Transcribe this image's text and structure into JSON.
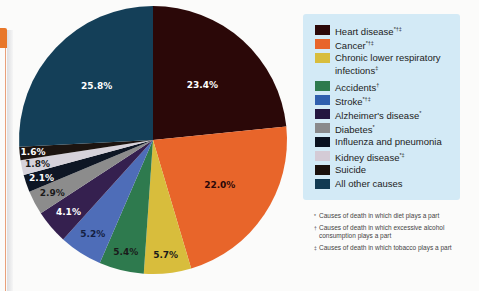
{
  "chart_data": {
    "type": "pie",
    "title": "",
    "start_angle": "12 o'clock",
    "direction": "clockwise",
    "slices": [
      {
        "name": "Heart disease",
        "marks": "*†‡",
        "value": 23.4,
        "label": "23.4%",
        "color": "#2b0808",
        "label_color": "#ffffff"
      },
      {
        "name": "Cancer",
        "marks": "*†‡",
        "value": 22.0,
        "label": "22.0%",
        "color": "#e8652a",
        "label_color": "#2b0808"
      },
      {
        "name": "Chronic lower respiratory infections",
        "marks": "‡",
        "value": 5.7,
        "label": "5.7%",
        "color": "#d8bd3c",
        "label_color": "#1a1a1a"
      },
      {
        "name": "Accidents",
        "marks": "†",
        "value": 5.4,
        "label": "5.4%",
        "color": "#2e7a4e",
        "label_color": "#1a1a1a"
      },
      {
        "name": "Stroke",
        "marks": "*†‡",
        "value": 5.2,
        "label": "5.2%",
        "color": "#4e6db8",
        "label_color": "#142041"
      },
      {
        "name": "Alzheimer's disease",
        "marks": "*",
        "value": 4.1,
        "label": "4.1%",
        "color": "#35204f",
        "label_color": "#ffffff"
      },
      {
        "name": "Diabetes",
        "marks": "*",
        "value": 2.9,
        "label": "2.9%",
        "color": "#8c8c8c",
        "label_color": "#1a1a1a"
      },
      {
        "name": "Influenza and pneumonia",
        "marks": "",
        "value": 2.1,
        "label": "2.1%",
        "color": "#0e1624",
        "label_color": "#ffffff"
      },
      {
        "name": "Kidney disease",
        "marks": "*‡",
        "value": 1.8,
        "label": "1.8%",
        "color": "#d6d2da",
        "label_color": "#1a1a1a"
      },
      {
        "name": "Suicide",
        "marks": "",
        "value": 1.6,
        "label": "1.6%",
        "color": "#1c1410",
        "label_color": "#ffffff"
      },
      {
        "name": "All other causes",
        "marks": "",
        "value": 25.8,
        "label": "25.8%",
        "color": "#143f58",
        "label_color": "#ffffff"
      }
    ],
    "legend_position": "right"
  },
  "legend": {
    "items": [
      {
        "label": "Heart disease",
        "marks": "*†‡",
        "color": "#2b0808"
      },
      {
        "label": "Cancer",
        "marks": "*†‡",
        "color": "#e8652a"
      },
      {
        "label": "Chronic lower respiratory infections",
        "marks": "‡",
        "color": "#d8bd3c"
      },
      {
        "label": "Accidents",
        "marks": "†",
        "color": "#2e7a4e"
      },
      {
        "label": "Stroke",
        "marks": "*†‡",
        "color": "#2f5fae"
      },
      {
        "label": "Alzheimer's disease",
        "marks": "*",
        "color": "#231640"
      },
      {
        "label": "Diabetes",
        "marks": "*",
        "color": "#8a8a8c"
      },
      {
        "label": "Influenza and pneumonia",
        "marks": "",
        "color": "#0b1220"
      },
      {
        "label": "Kidney disease",
        "marks": "*‡",
        "color": "#d4cbd6"
      },
      {
        "label": "Suicide",
        "marks": "",
        "color": "#1a100c"
      },
      {
        "label": "All other causes",
        "marks": "",
        "color": "#123a52"
      }
    ]
  },
  "footnotes": [
    {
      "mark": "*",
      "text": "Causes of death in which diet plays a part"
    },
    {
      "mark": "†",
      "text": "Causes of death in which excessive alcohol consumption plays a part"
    },
    {
      "mark": "‡",
      "text": "Causes of death in which tobacco plays a part"
    }
  ],
  "colors": {
    "accent_tab": "#e8772a",
    "legend_background": "#d3eaf6"
  }
}
